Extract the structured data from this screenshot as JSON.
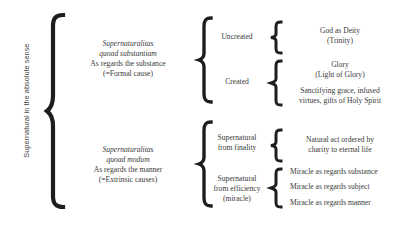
{
  "root": {
    "label_lines": [
      "Supernatural in the",
      "absolute sense"
    ]
  },
  "substance": {
    "latin_lines": [
      "Supernaturalitas",
      "quoad substantiam"
    ],
    "english_lines": [
      "As regards the substance",
      "(=Formal cause)"
    ],
    "uncreated": {
      "label": "Uncreated",
      "items": [
        {
          "lines": [
            "God as Deity",
            "(Trinity)"
          ]
        }
      ]
    },
    "created": {
      "label": "Created",
      "items": [
        {
          "lines": [
            "Glory",
            "(Light of Glory)"
          ]
        },
        {
          "lines": [
            "Sanctifying grace, infused",
            "virtues, gifts of Holy Spirit"
          ]
        }
      ]
    }
  },
  "manner": {
    "latin_lines": [
      "Supernaturalitas",
      "quoad modum"
    ],
    "english_lines": [
      "As regards the manner",
      "(=Extrinsic causes)"
    ],
    "finality": {
      "label_lines": [
        "Supernatural",
        "from finality"
      ],
      "items": [
        {
          "lines": [
            "Natural act ordered by",
            "charity to eternal life"
          ]
        }
      ]
    },
    "efficiency": {
      "label_lines": [
        "Supernatural",
        "from efficiency",
        "(miracle)"
      ],
      "items": [
        {
          "lines": [
            "Miracle as regards substance"
          ]
        },
        {
          "lines": [
            "Miracle as regards subject"
          ]
        },
        {
          "lines": [
            "Miracle as regards manner"
          ]
        }
      ]
    }
  },
  "colors": {
    "brace": "#1e1e1e",
    "text": "#3a3a3a"
  }
}
